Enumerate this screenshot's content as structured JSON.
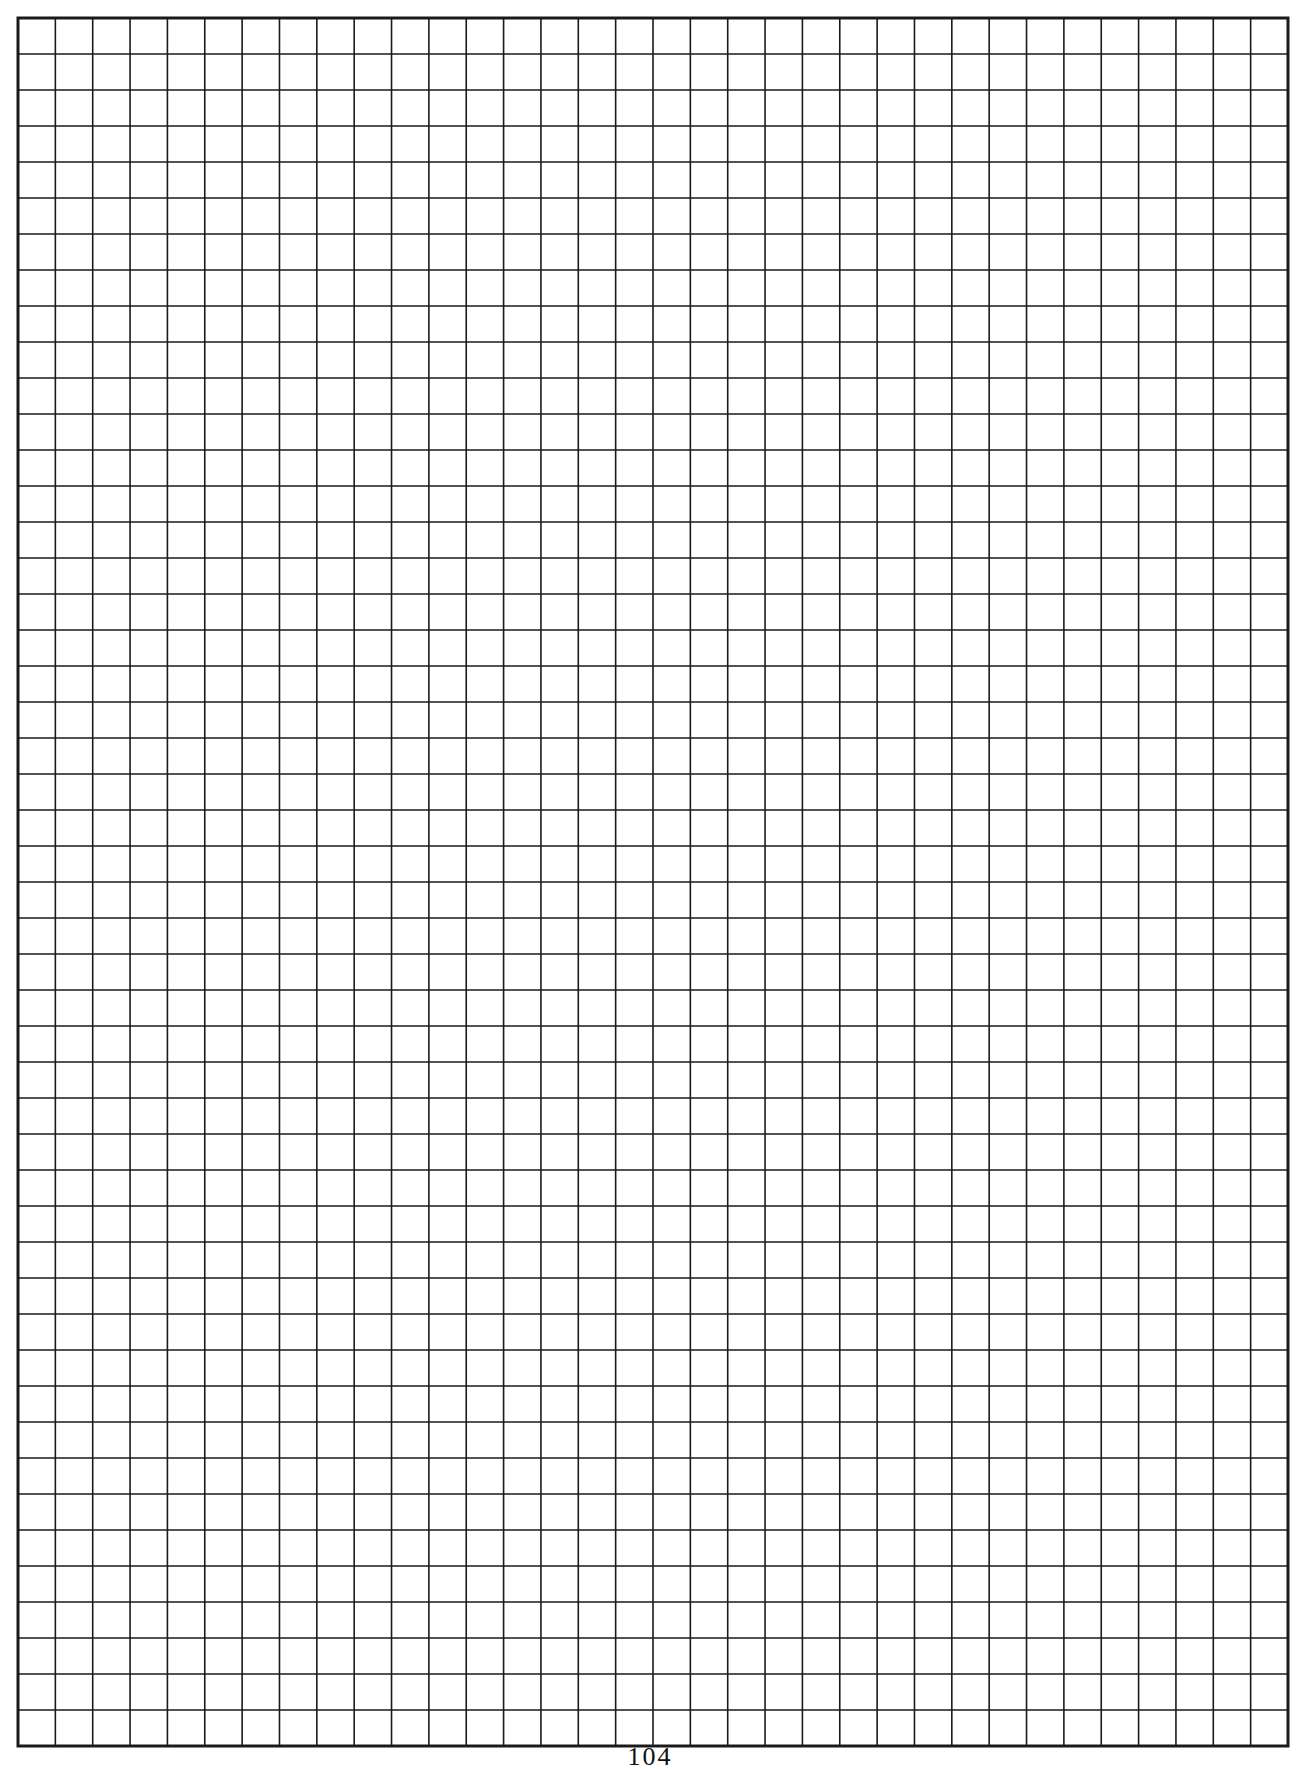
{
  "page": {
    "type": "graph-paper",
    "background": "#ffffff",
    "page_number": "104"
  },
  "grid": {
    "left": 18,
    "top": 18,
    "right": 1288,
    "bottom": 1746,
    "columns": 34,
    "rows": 48,
    "line_color": "#1a1a1a",
    "line_width": 1.6,
    "border_width": 3
  }
}
